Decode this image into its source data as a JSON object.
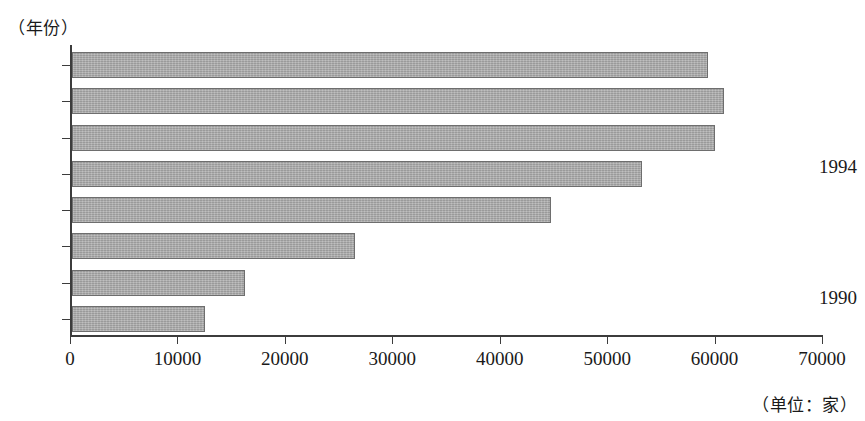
{
  "chart_data": {
    "type": "bar",
    "orientation": "horizontal",
    "title": "",
    "xlabel": "（单位：家）",
    "ylabel": "（年份）",
    "categories": [
      "1990",
      "1991",
      "1992",
      "1993",
      "1994",
      "1995",
      "1996",
      "1997"
    ],
    "values": [
      12400,
      16100,
      26300,
      44600,
      53100,
      59900,
      60700,
      59200
    ],
    "xlim": [
      0,
      70000
    ],
    "xticks": [
      "0",
      "10000",
      "20000",
      "30000",
      "40000",
      "50000",
      "60000",
      "70000"
    ],
    "xtick_values": [
      0,
      10000,
      20000,
      30000,
      40000,
      50000,
      60000,
      70000
    ],
    "visible_ytick_labels": [
      "1994",
      "1990"
    ],
    "grid": false,
    "legend": null,
    "bar_color": "#a9a9a9",
    "bar_border_color": "#6e6e6e",
    "axis_color": "#3c3c3c"
  },
  "captions": {
    "y_axis": "（年份）",
    "unit": "（单位：家）"
  },
  "y_labels": {
    "upper": "1994",
    "lower": "1990"
  }
}
